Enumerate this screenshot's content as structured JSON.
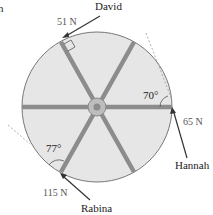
{
  "corner_fragment": "n",
  "wheel": {
    "fill_color": "#e6e6e6",
    "rim_color": "#777777",
    "spoke_color": "#8c8c8c",
    "hub_color": "#a8a8a8",
    "spoke_angles_deg": [
      0,
      60,
      120
    ]
  },
  "forces": [
    {
      "id": "david",
      "name": "David",
      "magnitude": "51 N",
      "angle_label": "",
      "right_angle": true
    },
    {
      "id": "hannah",
      "name": "Hannah",
      "magnitude": "65 N",
      "angle_label": "70°",
      "right_angle": false
    },
    {
      "id": "rabina",
      "name": "Rabina",
      "magnitude": "115 N",
      "angle_label": "77°",
      "right_angle": false
    }
  ]
}
